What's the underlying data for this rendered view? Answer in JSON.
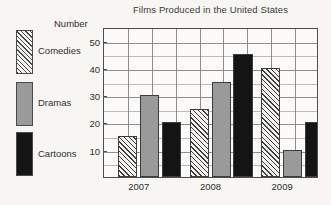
{
  "chart_data": {
    "type": "bar",
    "title": "Films Produced in the United States",
    "xlabel": "",
    "ylabel": "Number",
    "categories": [
      "2007",
      "2008",
      "2009"
    ],
    "series": [
      {
        "name": "Comedies",
        "values": [
          15,
          25,
          40
        ],
        "color": "#f4f3f0",
        "pattern": "diagonal-hatch"
      },
      {
        "name": "Dramas",
        "values": [
          30,
          35,
          10
        ],
        "color": "#9a9a9a",
        "pattern": "solid"
      },
      {
        "name": "Cartoons",
        "values": [
          20,
          45,
          20
        ],
        "color": "#141414",
        "pattern": "solid"
      }
    ],
    "ylim": [
      0,
      55
    ],
    "yticks": [
      10,
      20,
      30,
      40,
      50
    ],
    "ytick_labels": [
      "10",
      "20",
      "30",
      "40",
      "50"
    ],
    "minor_tick_step": 5,
    "grid": true,
    "legend_position": "left"
  },
  "legend": {
    "items": [
      {
        "label": "Comedies"
      },
      {
        "label": "Dramas"
      },
      {
        "label": "Cartoons"
      }
    ]
  }
}
